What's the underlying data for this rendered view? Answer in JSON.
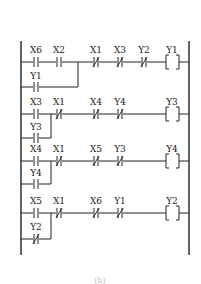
{
  "diagram": {
    "type": "ladder-logic",
    "caption": "(b)",
    "rungs": [
      {
        "contacts": [
          {
            "label": "X6",
            "type": "NO"
          },
          {
            "label": "X2",
            "type": "NO"
          },
          {
            "label": "X1",
            "type": "NC"
          },
          {
            "label": "X3",
            "type": "NC"
          },
          {
            "label": "Y2",
            "type": "NC"
          }
        ],
        "branch": {
          "label": "Y1",
          "type": "NO"
        },
        "coil": "Y1"
      },
      {
        "contacts": [
          {
            "label": "X3",
            "type": "NO"
          },
          {
            "label": "X1",
            "type": "NC"
          },
          {
            "label": "X4",
            "type": "NC"
          },
          {
            "label": "Y4",
            "type": "NC"
          }
        ],
        "branch": {
          "label": "Y3",
          "type": "NO"
        },
        "coil": "Y3"
      },
      {
        "contacts": [
          {
            "label": "X4",
            "type": "NO"
          },
          {
            "label": "X1",
            "type": "NC"
          },
          {
            "label": "X5",
            "type": "NC"
          },
          {
            "label": "Y3",
            "type": "NC"
          }
        ],
        "branch": {
          "label": "Y4",
          "type": "NO"
        },
        "coil": "Y4"
      },
      {
        "contacts": [
          {
            "label": "X5",
            "type": "NO"
          },
          {
            "label": "X1",
            "type": "NC"
          },
          {
            "label": "X6",
            "type": "NC"
          },
          {
            "label": "Y1",
            "type": "NC"
          }
        ],
        "branch": {
          "label": "Y2",
          "type": "NC"
        },
        "coil": "Y2"
      }
    ]
  }
}
